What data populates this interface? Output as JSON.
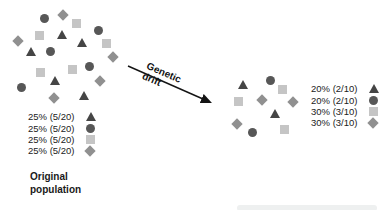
{
  "colors": {
    "triangle": "#454545",
    "circle": "#575757",
    "square": "#c5c5c5",
    "diamond": "#909090",
    "arrow": "#141414"
  },
  "arrow": {
    "label_line1": "Genetic",
    "label_line2": "drift"
  },
  "original_population": {
    "label_line1": "Original",
    "label_line2": "population",
    "legend": [
      {
        "text": "25% (5/20)",
        "shape": "triangle"
      },
      {
        "text": "25% (5/20)",
        "shape": "circle"
      },
      {
        "text": "25% (5/20)",
        "shape": "square"
      },
      {
        "text": "25% (5/20)",
        "shape": "diamond"
      }
    ],
    "shapes": [
      {
        "type": "circle",
        "x": 44,
        "y": 18
      },
      {
        "type": "circle",
        "x": 98,
        "y": 30
      },
      {
        "type": "circle",
        "x": 50,
        "y": 51
      },
      {
        "type": "circle",
        "x": 89,
        "y": 66
      },
      {
        "type": "circle",
        "x": 21,
        "y": 87
      },
      {
        "type": "triangle",
        "x": 62,
        "y": 35
      },
      {
        "type": "triangle",
        "x": 82,
        "y": 43
      },
      {
        "type": "triangle",
        "x": 31,
        "y": 52
      },
      {
        "type": "triangle",
        "x": 55,
        "y": 81
      },
      {
        "type": "triangle",
        "x": 84,
        "y": 96
      },
      {
        "type": "square",
        "x": 76,
        "y": 23
      },
      {
        "type": "square",
        "x": 39,
        "y": 35
      },
      {
        "type": "square",
        "x": 106,
        "y": 43
      },
      {
        "type": "square",
        "x": 40,
        "y": 72
      },
      {
        "type": "square",
        "x": 72,
        "y": 69
      },
      {
        "type": "diamond",
        "x": 63,
        "y": 15
      },
      {
        "type": "diamond",
        "x": 18,
        "y": 41
      },
      {
        "type": "diamond",
        "x": 113,
        "y": 57
      },
      {
        "type": "diamond",
        "x": 100,
        "y": 81
      },
      {
        "type": "diamond",
        "x": 54,
        "y": 98
      }
    ]
  },
  "drifted_population": {
    "legend": [
      {
        "text": "20% (2/10)",
        "shape": "triangle"
      },
      {
        "text": "20% (2/10)",
        "shape": "circle"
      },
      {
        "text": "30% (3/10)",
        "shape": "square"
      },
      {
        "text": "30% (3/10)",
        "shape": "diamond"
      }
    ],
    "shapes": [
      {
        "type": "triangle",
        "x": 243,
        "y": 85
      },
      {
        "type": "triangle",
        "x": 275,
        "y": 114
      },
      {
        "type": "circle",
        "x": 270,
        "y": 80
      },
      {
        "type": "circle",
        "x": 252,
        "y": 132
      },
      {
        "type": "square",
        "x": 282,
        "y": 89
      },
      {
        "type": "square",
        "x": 238,
        "y": 101
      },
      {
        "type": "square",
        "x": 284,
        "y": 129
      },
      {
        "type": "diamond",
        "x": 262,
        "y": 100
      },
      {
        "type": "diamond",
        "x": 293,
        "y": 102
      },
      {
        "type": "diamond",
        "x": 237,
        "y": 124
      }
    ]
  }
}
